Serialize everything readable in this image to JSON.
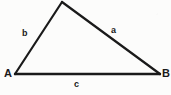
{
  "figure": {
    "type": "geometry-diagram",
    "shape": "triangle",
    "background_color": "#fcfcfb",
    "stroke_color": "#1a1a1a",
    "stroke_width": 2.2,
    "width": 171,
    "height": 95,
    "vertices": [
      {
        "id": "A",
        "label": "A",
        "x": 15,
        "y": 74,
        "label_x": 4,
        "label_y": 68,
        "labeled": true
      },
      {
        "id": "B",
        "label": "B",
        "x": 160,
        "y": 74,
        "label_x": 162,
        "label_y": 68,
        "labeled": true
      },
      {
        "id": "C",
        "label": "",
        "x": 62,
        "y": 2,
        "label_x": 0,
        "label_y": 0,
        "labeled": false
      }
    ],
    "sides": [
      {
        "id": "a",
        "label": "a",
        "from": "B",
        "to": "C",
        "label_x": 111,
        "label_y": 26
      },
      {
        "id": "b",
        "label": "b",
        "from": "A",
        "to": "C",
        "label_x": 22,
        "label_y": 29
      },
      {
        "id": "c",
        "label": "c",
        "from": "A",
        "to": "B",
        "label_x": 74,
        "label_y": 80
      }
    ]
  }
}
